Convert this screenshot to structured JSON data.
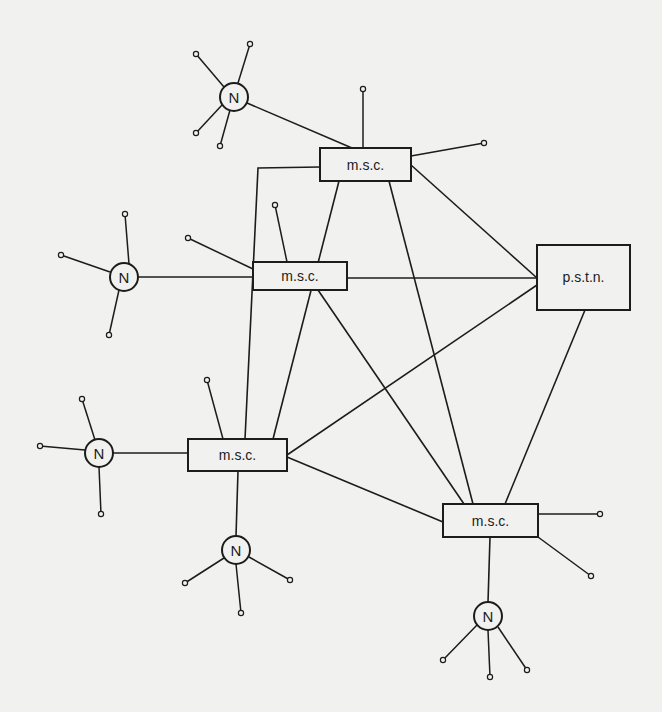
{
  "diagram": {
    "title": "",
    "nodes": {
      "msc_top": {
        "label": "m.s.c.",
        "x": 320,
        "y": 148,
        "w": 91,
        "h": 33
      },
      "msc_mid": {
        "label": "m.s.c.",
        "x": 253,
        "y": 262,
        "w": 94,
        "h": 28
      },
      "pstn": {
        "label": "p.s.t.n.",
        "x": 537,
        "y": 245,
        "w": 93,
        "h": 65
      },
      "msc_left": {
        "label": "m.s.c.",
        "x": 188,
        "y": 439,
        "w": 99,
        "h": 32
      },
      "msc_right": {
        "label": "m.s.c.",
        "x": 443,
        "y": 504,
        "w": 95,
        "h": 33
      },
      "n1": {
        "label": "N",
        "cx": 234,
        "cy": 97,
        "r": 14
      },
      "n2": {
        "label": "N",
        "cx": 124,
        "cy": 277,
        "r": 14
      },
      "n3": {
        "label": "N",
        "cx": 99,
        "cy": 453,
        "r": 14
      },
      "n4": {
        "label": "N",
        "cx": 236,
        "cy": 550,
        "r": 14
      },
      "n5": {
        "label": "N",
        "cx": 488,
        "cy": 616,
        "r": 14
      }
    },
    "edges": [
      {
        "from": "n1",
        "to": "msc_top"
      },
      {
        "from": "n2",
        "to": "msc_mid"
      },
      {
        "from": "n3",
        "to": "msc_left"
      },
      {
        "from": "msc_left",
        "to": "n4"
      },
      {
        "from": "msc_right",
        "to": "n5"
      },
      {
        "from": "msc_top",
        "to": "msc_mid"
      },
      {
        "from": "msc_top",
        "to": "msc_left"
      },
      {
        "from": "msc_top",
        "to": "pstn"
      },
      {
        "from": "msc_top",
        "to": "msc_right"
      },
      {
        "from": "msc_mid",
        "to": "pstn"
      },
      {
        "from": "msc_mid",
        "to": "msc_left"
      },
      {
        "from": "msc_mid",
        "to": "msc_right"
      },
      {
        "from": "msc_left",
        "to": "pstn"
      },
      {
        "from": "msc_left",
        "to": "msc_right"
      },
      {
        "from": "pstn",
        "to": "msc_right"
      }
    ],
    "legend": {
      "msc": "m.s.c.",
      "pstn": "p.s.t.n.",
      "network_node": "N"
    }
  }
}
